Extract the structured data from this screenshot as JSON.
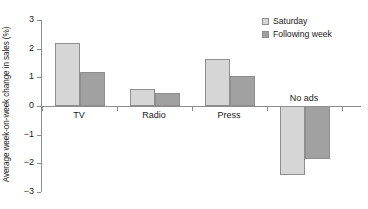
{
  "chart_data": {
    "type": "bar",
    "title": "",
    "subtitle": "",
    "xlabel": "",
    "ylabel": "Average week-on-week change in sales (%)",
    "categories": [
      "TV",
      "Radio",
      "Press",
      "No ads"
    ],
    "series": [
      {
        "name": "Saturday",
        "color": "#d6d6d6",
        "values": [
          2.2,
          0.6,
          1.65,
          -2.4
        ]
      },
      {
        "name": "Following week",
        "color": "#a1a1a1",
        "values": [
          1.2,
          0.45,
          1.05,
          -1.85
        ]
      }
    ],
    "ylim": [
      -3,
      3
    ],
    "yticks": [
      3,
      2,
      1,
      0,
      -1,
      -2,
      -3
    ],
    "ytick_labels": [
      "3",
      "2",
      "1",
      "0",
      "−1",
      "−2",
      "−3"
    ],
    "grid": false,
    "legend_position": "top-right",
    "annotations": []
  },
  "legend": {
    "items": [
      {
        "label": "Saturday",
        "swatch": "light-gray-square"
      },
      {
        "label": "Following week",
        "swatch": "dark-gray-square"
      }
    ]
  },
  "axes": {
    "y_title": "Average week-on-week change in sales (%)",
    "y_tick_labels": [
      "3",
      "2",
      "1",
      "0",
      "−1",
      "−2",
      "−3"
    ],
    "x_tick_labels": [
      "TV",
      "Radio",
      "Press",
      "No ads"
    ]
  },
  "colors": {
    "saturday": "#d6d6d6",
    "following_week": "#a1a1a1",
    "axis": "#8d8d8d",
    "bar_outline": "#8e8e8e",
    "text": "#1a1a1a",
    "background": "#ffffff"
  }
}
